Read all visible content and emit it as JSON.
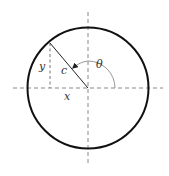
{
  "diagram": {
    "colors": {
      "background": "#ffffff",
      "circle": "#111111",
      "axes": "#888888",
      "radius_line": "#222222",
      "dashed_leg": "#777777",
      "arc": "#999999",
      "label": "#333333"
    },
    "geometry": {
      "center": [
        88,
        88
      ],
      "radius": 60,
      "point_on_circle": [
        50,
        43
      ],
      "arc_radius": 27,
      "h_axis": [
        13,
        163
      ],
      "v_axis": [
        12,
        165
      ]
    },
    "labels": {
      "y": "y",
      "c": "c",
      "theta": "θ",
      "x": "x"
    },
    "elements": [
      {
        "name": "circle",
        "type": "circle"
      },
      {
        "name": "horizontal-axis",
        "type": "dashed-line"
      },
      {
        "name": "vertical-axis",
        "type": "dashed-line"
      },
      {
        "name": "hypotenuse-c",
        "type": "line",
        "label": "c"
      },
      {
        "name": "leg-y",
        "type": "dashed-line",
        "label": "y"
      },
      {
        "name": "leg-x",
        "type": "segment-on-axis",
        "label": "x"
      },
      {
        "name": "angle-arc-theta",
        "type": "arc-with-arrow",
        "label": "θ"
      }
    ]
  }
}
